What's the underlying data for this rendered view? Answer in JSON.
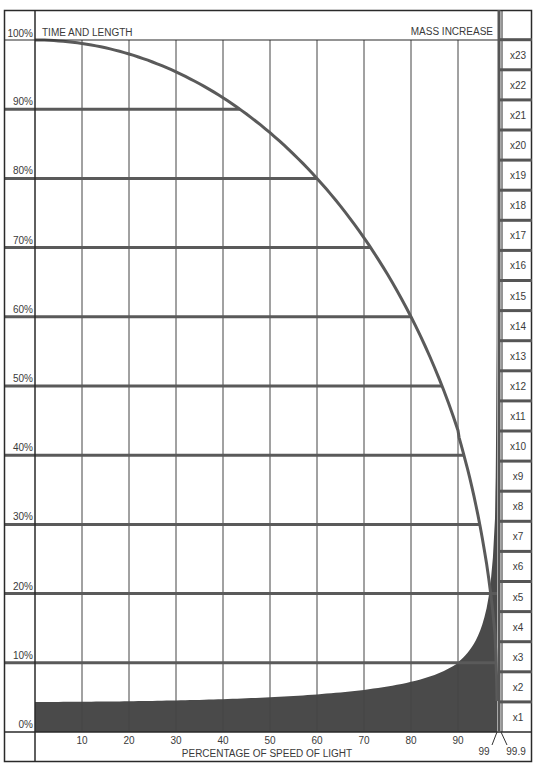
{
  "chart_data": {
    "type": "line",
    "title": "",
    "left_header": "TIME AND LENGTH",
    "right_header": "MASS INCREASE",
    "xlabel": "PERCENTAGE OF SPEED OF LIGHT",
    "ylabel": "",
    "x_ticks": [
      "10",
      "20",
      "30",
      "40",
      "50",
      "60",
      "70",
      "80",
      "90"
    ],
    "x_extra_ticks": [
      "99",
      "99.9"
    ],
    "y_ticks": [
      "0%",
      "10%",
      "20%",
      "30%",
      "40%",
      "50%",
      "60%",
      "70%",
      "80%",
      "90%",
      "100%"
    ],
    "mass_ticks": [
      "x1",
      "x2",
      "x3",
      "x4",
      "x5",
      "x6",
      "x7",
      "x8",
      "x9",
      "x10",
      "x11",
      "x12",
      "x13",
      "x14",
      "x15",
      "x16",
      "x17",
      "x18",
      "x19",
      "x20",
      "x21",
      "x22",
      "x23"
    ],
    "ylim": [
      0,
      100
    ],
    "xlim": [
      0,
      99.9
    ],
    "grid": true,
    "series": [
      {
        "name": "Time and length contraction (%)",
        "style": "curve",
        "x": [
          0,
          10,
          20,
          30,
          40,
          50,
          60,
          70,
          80,
          90,
          95,
          99,
          99.9
        ],
        "values": [
          100,
          99.5,
          98,
          95.4,
          91.7,
          86.6,
          80,
          71.4,
          60,
          43.6,
          31.2,
          14.1,
          4.5
        ]
      },
      {
        "name": "Mass increase (multiple)",
        "style": "filled-area",
        "x": [
          0,
          10,
          20,
          30,
          40,
          50,
          60,
          70,
          80,
          90,
          95,
          99,
          99.9
        ],
        "values": [
          1.0,
          1.005,
          1.02,
          1.05,
          1.09,
          1.15,
          1.25,
          1.4,
          1.67,
          2.29,
          3.2,
          7.09,
          22.4
        ]
      }
    ],
    "horizontal_bars": [
      {
        "level": "10%",
        "x_end": 99.5
      },
      {
        "level": "20%",
        "x_end": 99.9
      },
      {
        "level": "30%",
        "x_end": 95.4
      },
      {
        "level": "40%",
        "x_end": 91.7
      },
      {
        "level": "50%",
        "x_end": 86.6
      },
      {
        "level": "60%",
        "x_end": 80
      },
      {
        "level": "70%",
        "x_end": 71.4
      },
      {
        "level": "80%",
        "x_end": 60
      },
      {
        "level": "90%",
        "x_end": 43.6
      }
    ]
  },
  "colors": {
    "frame": "#2a2a2a",
    "grid": "#555555",
    "curve": "#555555",
    "fill": "#4a4a4a",
    "bar": "#5a5a5a",
    "text": "#3a3a3a"
  }
}
